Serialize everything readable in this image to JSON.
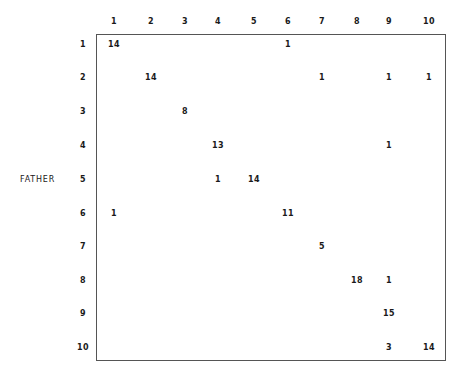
{
  "chart_data": {
    "type": "table",
    "title": "",
    "row_axis_label": "FATHER",
    "col_axis_label": "",
    "columns": [
      "1",
      "2",
      "3",
      "4",
      "5",
      "6",
      "7",
      "8",
      "9",
      "10"
    ],
    "rows": [
      "1",
      "2",
      "3",
      "4",
      "5",
      "6",
      "7",
      "8",
      "9",
      "10"
    ],
    "cells": [
      {
        "row": 1,
        "col": 1,
        "value": 14
      },
      {
        "row": 1,
        "col": 6,
        "value": 1
      },
      {
        "row": 2,
        "col": 2,
        "value": 14
      },
      {
        "row": 2,
        "col": 7,
        "value": 1
      },
      {
        "row": 2,
        "col": 9,
        "value": 1
      },
      {
        "row": 2,
        "col": 10,
        "value": 1
      },
      {
        "row": 3,
        "col": 3,
        "value": 8
      },
      {
        "row": 4,
        "col": 4,
        "value": 13
      },
      {
        "row": 4,
        "col": 9,
        "value": 1
      },
      {
        "row": 5,
        "col": 4,
        "value": 1
      },
      {
        "row": 5,
        "col": 5,
        "value": 14
      },
      {
        "row": 6,
        "col": 1,
        "value": 1
      },
      {
        "row": 6,
        "col": 6,
        "value": 11
      },
      {
        "row": 7,
        "col": 7,
        "value": 5
      },
      {
        "row": 8,
        "col": 8,
        "value": 18
      },
      {
        "row": 8,
        "col": 9,
        "value": 1
      },
      {
        "row": 9,
        "col": 9,
        "value": 15
      },
      {
        "row": 10,
        "col": 9,
        "value": 3
      },
      {
        "row": 10,
        "col": 10,
        "value": 14
      }
    ],
    "grid": false,
    "legend": null
  },
  "layout": {
    "col_x": [
      114,
      151,
      185,
      218,
      254,
      288,
      322,
      357,
      389,
      429
    ],
    "row_y": [
      44,
      77,
      111,
      145,
      179,
      213,
      246,
      280,
      313,
      347
    ],
    "col_header_y": 21,
    "row_header_x": 83
  }
}
